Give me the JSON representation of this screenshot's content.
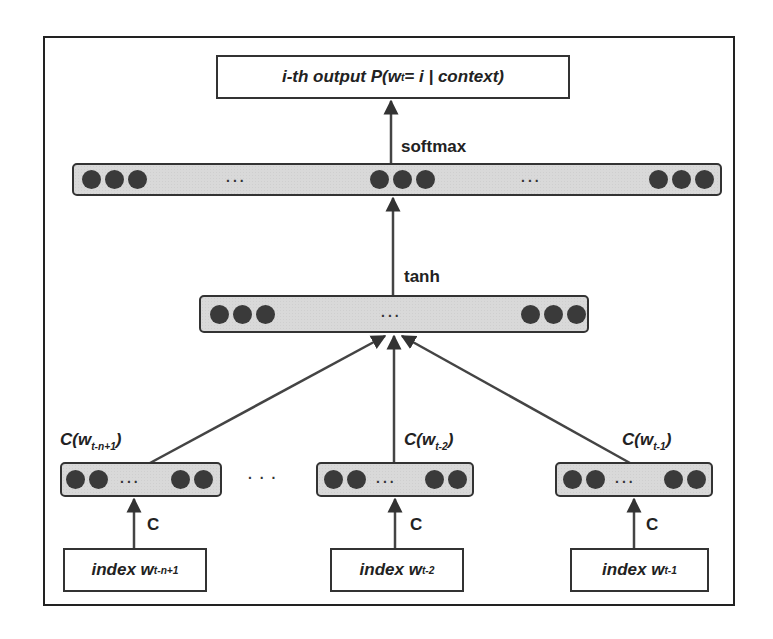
{
  "diagram": {
    "type": "neural-probabilistic-language-model",
    "output_box": {
      "prefix": "i-th output P(w",
      "sub": "t",
      "suffix": " = i | context)"
    },
    "labels": {
      "softmax": "softmax",
      "tanh": "tanh",
      "ellipsis": "...",
      "between_inputs_ellipsis": ". . ."
    },
    "layers": {
      "softmax_layer": {
        "left_dots": 3,
        "middle_dots": 3,
        "right_dots": 3
      },
      "tanh_layer": {
        "left_dots": 3,
        "right_dots": 3
      }
    },
    "inputs": [
      {
        "embedding_label": "C(w",
        "embedding_sub": "t-n+1",
        "embedding_close": ")",
        "projection_label": "C",
        "index_label": "index w",
        "index_sub": "t-n+1"
      },
      {
        "embedding_label": "C(w",
        "embedding_sub": "t-2",
        "embedding_close": ")",
        "projection_label": "C",
        "index_label": "index w",
        "index_sub": "t-2"
      },
      {
        "embedding_label": "C(w",
        "embedding_sub": "t-1",
        "embedding_close": ")",
        "projection_label": "C",
        "index_label": "index w",
        "index_sub": "t-1"
      }
    ],
    "colors": {
      "stroke": "#333333",
      "layer_fill": "#d9d9d9",
      "unit": "#3a3a3a"
    }
  }
}
